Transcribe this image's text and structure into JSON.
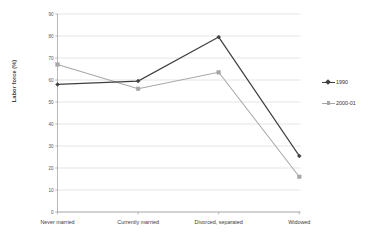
{
  "chart_data": {
    "type": "line",
    "title": "",
    "xlabel": "",
    "ylabel": "Labor force (%)",
    "categories": [
      "Never married",
      "Currently married",
      "Divorced, separated",
      "Widowed"
    ],
    "series": [
      {
        "name": "1990",
        "values": [
          58,
          59.5,
          79.5,
          25.5
        ],
        "color": "#3f3f3f",
        "marker": "diamond"
      },
      {
        "name": "2000-01",
        "values": [
          67,
          56,
          63.5,
          16
        ],
        "color": "#a6a6a6",
        "marker": "square"
      }
    ],
    "ylim": [
      0,
      90
    ],
    "ytick_step": 10,
    "yticks": [
      "0",
      "10",
      "20",
      "30",
      "40",
      "50",
      "60",
      "70",
      "80",
      "90"
    ],
    "grid": true,
    "legend_position": "right"
  },
  "axis": {
    "y_title": "Labor force (%)"
  },
  "legend": {
    "items": [
      {
        "label": "1990"
      },
      {
        "label": "2000-01"
      }
    ]
  },
  "colors": {
    "series_1990": "#3f3f3f",
    "series_2000_01": "#a6a6a6",
    "gridline": "#d4d4d4",
    "axis": "#9a9a9a",
    "background": "#ffffff"
  }
}
